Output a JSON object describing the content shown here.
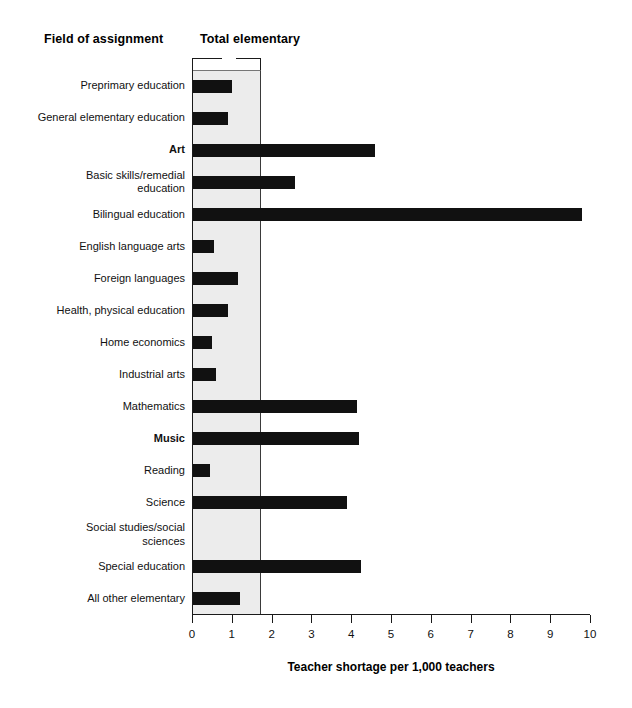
{
  "header": {
    "field_title": "Field of assignment",
    "total_title": "Total elementary"
  },
  "chart_data": {
    "type": "bar",
    "orientation": "horizontal",
    "title": "",
    "xlabel": "Teacher shortage per 1,000 teachers",
    "ylabel": "Field of assignment",
    "xlim": [
      0,
      10
    ],
    "xticks": [
      0,
      1,
      2,
      3,
      4,
      5,
      6,
      7,
      8,
      9,
      10
    ],
    "xtick_labels": [
      "0",
      "1",
      "2",
      "3",
      "4",
      "5",
      "6",
      "7",
      "8",
      "9",
      "10"
    ],
    "grid": false,
    "legend": null,
    "reference_band": {
      "label": "Total elementary",
      "from": 0,
      "to": 1.73,
      "color": "#ececec"
    },
    "bar_color": "#111111",
    "categories": [
      "Preprimary education",
      "General elementary education",
      "Art",
      "Basic skills/remedial education",
      "Bilingual education",
      "English language arts",
      "Foreign languages",
      "Health, physical education",
      "Home economics",
      "Industrial arts",
      "Mathematics",
      "Music",
      "Reading",
      "Science",
      "Social studies/social sciences",
      "Special education",
      "All other elementary"
    ],
    "category_labels_wrapped": [
      "Preprimary education",
      "General elementary education",
      "Art",
      "Basic skills/remedial\neducation",
      "Bilingual education",
      "English language arts",
      "Foreign languages",
      "Health, physical education",
      "Home economics",
      "Industrial arts",
      "Mathematics",
      "Music",
      "Reading",
      "Science",
      "Social studies/social\nsciences",
      "Special education",
      "All other elementary"
    ],
    "emphasized_categories": [
      "Art",
      "Music"
    ],
    "values": [
      1.0,
      0.9,
      4.6,
      2.6,
      9.8,
      0.55,
      1.15,
      0.9,
      0.5,
      0.6,
      4.15,
      4.2,
      0.45,
      3.9,
      0.0,
      4.25,
      1.2
    ]
  }
}
